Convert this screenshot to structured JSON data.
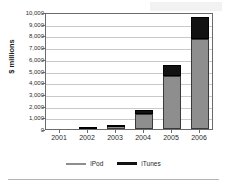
{
  "chart_data": {
    "type": "bar",
    "stacked": true,
    "title": "",
    "xlabel": "",
    "ylabel": "$ millions",
    "categories": [
      "2001",
      "2002",
      "2003",
      "2004",
      "2005",
      "2006"
    ],
    "series": [
      {
        "name": "iPod",
        "color": "#8e8e8e",
        "values": [
          0,
          143,
          345,
          1306,
          4540,
          7676
        ]
      },
      {
        "name": "iTunes",
        "color": "#121212",
        "values": [
          0,
          4,
          36,
          278,
          899,
          1885
        ]
      }
    ],
    "ylim": [
      0,
      10000
    ],
    "ytick_values": [
      0,
      1000,
      2000,
      3000,
      4000,
      5000,
      6000,
      7000,
      8000,
      9000,
      10000
    ],
    "ytick_labels": [
      "0",
      "1,000",
      "2,000",
      "3,000",
      "4,000",
      "5,000",
      "6,000",
      "7,000",
      "8,000",
      "9,000",
      "10,000"
    ],
    "grid": true,
    "legend_position": "bottom",
    "legend_entries": [
      "iPod",
      "iTunes"
    ]
  }
}
